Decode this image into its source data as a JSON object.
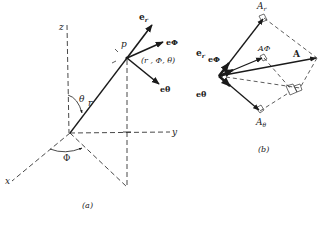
{
  "figure": {
    "panel_a": {
      "caption": "(a)",
      "axes": {
        "z": "z",
        "y": "y",
        "x": "x"
      },
      "point_label": "p",
      "coords_label": "(r , Φ, θ)",
      "radius_label": "r",
      "theta_label": "θ",
      "phi_label": "Φ",
      "unit_vectors": {
        "e_r": "e",
        "e_r_sub": "r",
        "e_phi": "eΦ",
        "e_theta": "eθ"
      }
    },
    "panel_b": {
      "caption": "(b)",
      "vector_label": "A",
      "components": {
        "A_r": "A",
        "A_r_sub": "r",
        "A_phi": "AΦ",
        "A_theta": "A",
        "A_theta_sub": "θ"
      },
      "unit_vectors": {
        "e_r": "e",
        "e_r_sub": "r",
        "e_phi": "eΦ",
        "e_theta": "eθ"
      }
    },
    "colors": {
      "ink": "#1a1a1a",
      "background": "#ffffff"
    }
  }
}
